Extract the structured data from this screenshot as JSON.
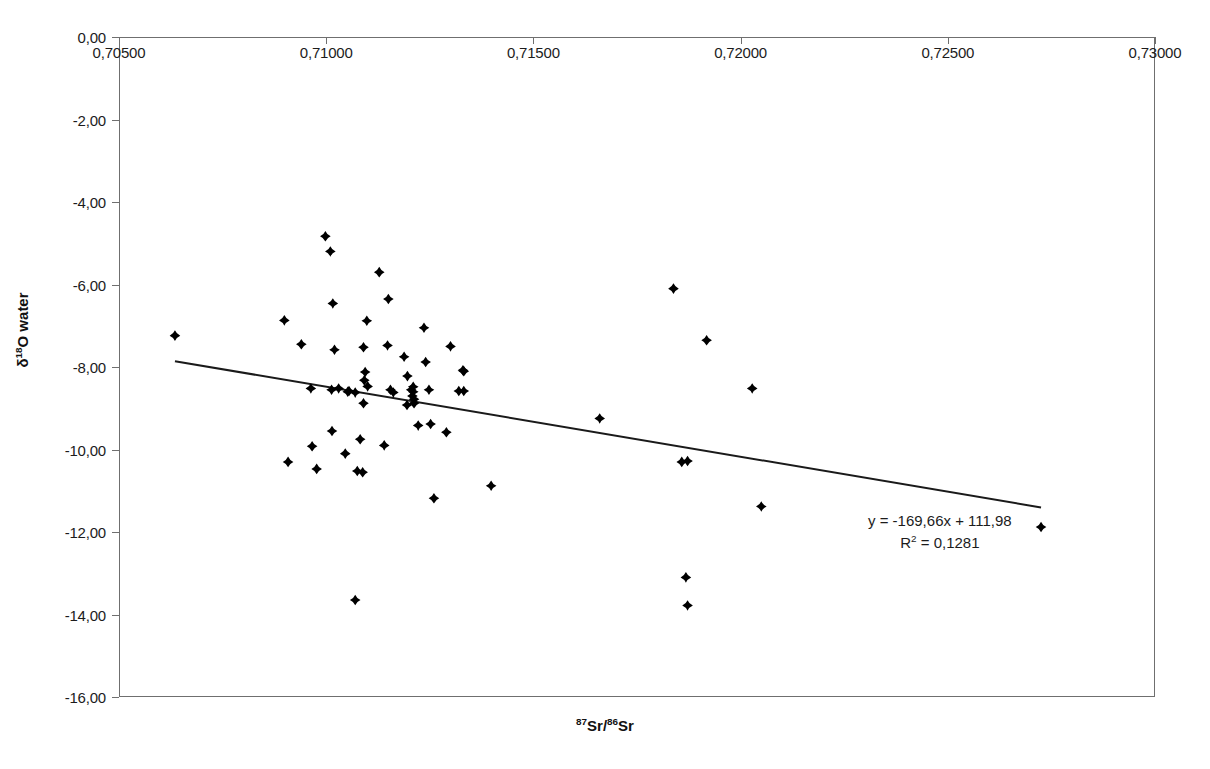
{
  "chart_data": {
    "type": "scatter",
    "title": "",
    "xlabel": "87Sr/86Sr",
    "ylabel": "d18O water",
    "xlabel_parts": {
      "sup1": "87",
      "mid": "Sr/",
      "sup2": "86",
      "tail": "Sr"
    },
    "ylabel_parts": {
      "delta": "δ",
      "sup": "18",
      "tail": "O water"
    },
    "xlim": [
      0.705,
      0.73
    ],
    "ylim": [
      -16.0,
      0.0
    ],
    "x_axis_position": "top",
    "grid": false,
    "legend": false,
    "xticks": [
      "0,70500",
      "0,71000",
      "0,71500",
      "0,72000",
      "0,72500",
      "0,73000"
    ],
    "xtick_values": [
      0.705,
      0.71,
      0.715,
      0.72,
      0.725,
      0.73
    ],
    "yticks": [
      "0,00",
      "-2,00",
      "-4,00",
      "-6,00",
      "-8,00",
      "-10,00",
      "-12,00",
      "-14,00",
      "-16,00"
    ],
    "ytick_values": [
      0,
      -2,
      -4,
      -6,
      -8,
      -10,
      -12,
      -14,
      -16
    ],
    "marker": "diamond",
    "marker_color": "#000000",
    "marker_size": 8,
    "annotations": {
      "equation": "y = -169,66x + 111,98",
      "r_squared": "R",
      "r_squared_sup": "2",
      "r_squared_value": " = 0,1281"
    },
    "trendline": {
      "slope": -169.66,
      "intercept": 111.98,
      "r2": 0.1281,
      "x_start": 0.70635,
      "x_end": 0.72725,
      "color": "#1a1a1a",
      "width": 2
    },
    "points": [
      [
        0.70635,
        -7.24
      ],
      [
        0.70899,
        -6.87
      ],
      [
        0.7094,
        -7.45
      ],
      [
        0.70963,
        -8.52
      ],
      [
        0.70966,
        -9.92
      ],
      [
        0.70908,
        -10.3
      ],
      [
        0.70977,
        -10.47
      ],
      [
        0.71016,
        -6.46
      ],
      [
        0.7102,
        -7.58
      ],
      [
        0.71013,
        -8.55
      ],
      [
        0.71014,
        -9.55
      ],
      [
        0.7103,
        -8.52
      ],
      [
        0.71055,
        -8.58
      ],
      [
        0.71046,
        -10.1
      ],
      [
        0.70998,
        -4.83
      ],
      [
        0.7101,
        -5.2
      ],
      [
        0.7109,
        -7.52
      ],
      [
        0.71098,
        -6.88
      ],
      [
        0.71094,
        -8.12
      ],
      [
        0.71092,
        -8.32
      ],
      [
        0.711,
        -8.47
      ],
      [
        0.7109,
        -8.88
      ],
      [
        0.71082,
        -9.75
      ],
      [
        0.71075,
        -10.52
      ],
      [
        0.71088,
        -10.55
      ],
      [
        0.71052,
        -8.6
      ],
      [
        0.7107,
        -8.62
      ],
      [
        0.7115,
        -6.35
      ],
      [
        0.71148,
        -7.48
      ],
      [
        0.71155,
        -8.55
      ],
      [
        0.71162,
        -8.62
      ],
      [
        0.7114,
        -9.9
      ],
      [
        0.7107,
        -13.65
      ],
      [
        0.71188,
        -7.75
      ],
      [
        0.71196,
        -8.22
      ],
      [
        0.7121,
        -8.48
      ],
      [
        0.71205,
        -8.55
      ],
      [
        0.7121,
        -8.6
      ],
      [
        0.71208,
        -8.7
      ],
      [
        0.71212,
        -8.78
      ],
      [
        0.71212,
        -8.88
      ],
      [
        0.71195,
        -8.92
      ],
      [
        0.71222,
        -9.42
      ],
      [
        0.71128,
        -5.7
      ],
      [
        0.71236,
        -7.05
      ],
      [
        0.7124,
        -7.88
      ],
      [
        0.71248,
        -8.55
      ],
      [
        0.71252,
        -9.38
      ],
      [
        0.7126,
        -11.18
      ],
      [
        0.7129,
        -9.58
      ],
      [
        0.7132,
        -8.58
      ],
      [
        0.71332,
        -8.58
      ],
      [
        0.713,
        -7.5
      ],
      [
        0.7133,
        -8.08
      ],
      [
        0.71332,
        -8.1
      ],
      [
        0.71398,
        -10.88
      ],
      [
        0.7166,
        -9.25
      ],
      [
        0.71838,
        -6.1
      ],
      [
        0.71858,
        -10.3
      ],
      [
        0.71872,
        -10.28
      ],
      [
        0.71868,
        -13.1
      ],
      [
        0.71872,
        -13.78
      ],
      [
        0.71918,
        -7.35
      ],
      [
        0.72028,
        -8.52
      ],
      [
        0.7205,
        -11.38
      ],
      [
        0.72725,
        -11.88
      ]
    ]
  }
}
